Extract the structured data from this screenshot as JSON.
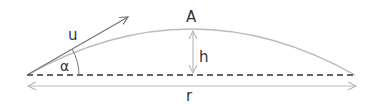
{
  "diagram": {
    "type": "projectile-motion",
    "labels": {
      "velocity": "u",
      "angle": "α",
      "apex": "A",
      "max_height": "h",
      "range": "r"
    },
    "colors": {
      "trajectory": "#bbbbbb",
      "velocity_arrow": "#777777",
      "ground": "#333333",
      "dimension_arrows": "#bbbbbb",
      "text": "#333333"
    }
  }
}
